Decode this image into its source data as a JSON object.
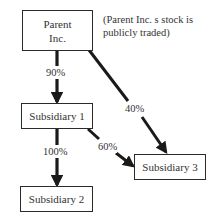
{
  "diagram": {
    "type": "ownership-structure",
    "nodes": [
      {
        "id": "parent",
        "lines": [
          "Parent",
          "Inc."
        ]
      },
      {
        "id": "sub1",
        "lines": [
          "Subsidiary 1"
        ]
      },
      {
        "id": "sub2",
        "lines": [
          "Subsidiary 2"
        ]
      },
      {
        "id": "sub3",
        "lines": [
          "Subsidiary 3"
        ]
      }
    ],
    "edges": [
      {
        "from": "parent",
        "to": "sub1",
        "label": "90%"
      },
      {
        "from": "parent",
        "to": "sub3",
        "label": "40%"
      },
      {
        "from": "sub1",
        "to": "sub2",
        "label": "100%"
      },
      {
        "from": "sub1",
        "to": "sub3",
        "label": "60%"
      }
    ],
    "note": {
      "line1": "(Parent Inc. s stock is",
      "line2": "publicly traded)"
    }
  },
  "colors": {
    "stroke": "#1a1a1a",
    "background": "#ffffff",
    "text": "#333333"
  }
}
